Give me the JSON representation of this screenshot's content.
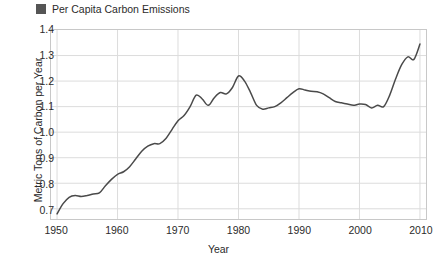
{
  "legend": {
    "items": [
      {
        "label": "Per Capita Carbon Emissions",
        "color": "#555555",
        "marker": "square"
      }
    ],
    "position": "top-left"
  },
  "axis_titles": {
    "x": "Year",
    "y": "Metric Tons of Carbon per Year"
  },
  "ticks": {
    "y": [
      "0.7",
      "0.8",
      "0.9",
      "1.0",
      "1.1",
      "1.2",
      "1.3",
      "1.4"
    ],
    "x": [
      "1950",
      "1960",
      "1970",
      "1980",
      "1990",
      "2000",
      "2010"
    ]
  },
  "chart_data": {
    "type": "line",
    "title": "",
    "xlabel": "Year",
    "ylabel": "Metric Tons of Carbon per Year",
    "xlim": [
      1949,
      2011
    ],
    "ylim": [
      0.66,
      1.4
    ],
    "xticks": [
      1950,
      1960,
      1970,
      1980,
      1990,
      2000,
      2010
    ],
    "yticks": [
      0.7,
      0.8,
      0.9,
      1.0,
      1.1,
      1.2,
      1.3,
      1.4
    ],
    "grid": true,
    "legend_position": "top-left",
    "series": [
      {
        "name": "Per Capita Carbon Emissions",
        "color": "#4a4a4a",
        "line_width": 1.5,
        "x": [
          1950,
          1951,
          1952,
          1953,
          1954,
          1955,
          1956,
          1957,
          1958,
          1959,
          1960,
          1961,
          1962,
          1963,
          1964,
          1965,
          1966,
          1967,
          1968,
          1969,
          1970,
          1971,
          1972,
          1973,
          1974,
          1975,
          1976,
          1977,
          1978,
          1979,
          1980,
          1981,
          1982,
          1983,
          1984,
          1985,
          1986,
          1987,
          1988,
          1989,
          1990,
          1991,
          1992,
          1993,
          1994,
          1995,
          1996,
          1997,
          1998,
          1999,
          2000,
          2001,
          2002,
          2003,
          2004,
          2005,
          2006,
          2007,
          2008,
          2009,
          2010
        ],
        "y": [
          0.68,
          0.72,
          0.745,
          0.752,
          0.748,
          0.752,
          0.758,
          0.762,
          0.79,
          0.815,
          0.835,
          0.845,
          0.865,
          0.895,
          0.925,
          0.945,
          0.955,
          0.955,
          0.975,
          1.01,
          1.045,
          1.065,
          1.1,
          1.145,
          1.13,
          1.105,
          1.135,
          1.155,
          1.15,
          1.175,
          1.22,
          1.2,
          1.155,
          1.105,
          1.09,
          1.095,
          1.1,
          1.115,
          1.135,
          1.155,
          1.17,
          1.165,
          1.16,
          1.158,
          1.15,
          1.135,
          1.12,
          1.115,
          1.11,
          1.105,
          1.11,
          1.108,
          1.095,
          1.105,
          1.1,
          1.145,
          1.21,
          1.265,
          1.295,
          1.285,
          1.345
        ]
      }
    ]
  }
}
